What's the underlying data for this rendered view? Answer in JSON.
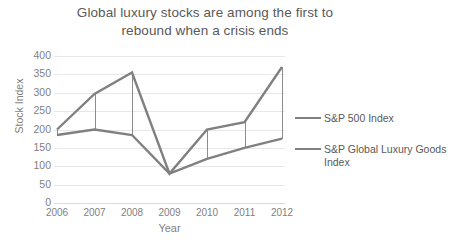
{
  "chart_data": {
    "type": "line",
    "title": "Global luxury stocks are among the first to rebound when a crisis ends",
    "title_line1": "Global luxury stocks are among the first to",
    "title_line2": "rebound when a crisis ends",
    "xlabel": "Year",
    "ylabel": "Stock Index",
    "categories": [
      "2006",
      "2007",
      "2008",
      "2009",
      "2010",
      "2011",
      "2012"
    ],
    "x": [
      2006,
      2007,
      2008,
      2009,
      2010,
      2011,
      2012
    ],
    "ylim": [
      0,
      400
    ],
    "ytick_labels": [
      "400",
      "350",
      "300",
      "250",
      "200",
      "150",
      "100",
      "50",
      "0"
    ],
    "ytick_values": [
      400,
      350,
      300,
      250,
      200,
      150,
      100,
      50,
      0
    ],
    "grid": true,
    "legend_position": "right",
    "series": [
      {
        "name": "S&P 500 Index",
        "color": "#808080",
        "values": [
          185,
          200,
          185,
          80,
          120,
          150,
          175
        ]
      },
      {
        "name": "S&P Global Luxury Goods Index",
        "name_line1": "S&P Global Luxury Goods",
        "name_line2": "Index",
        "color": "#808080",
        "values": [
          200,
          297,
          355,
          80,
          200,
          220,
          370
        ]
      }
    ]
  },
  "legend": {
    "entries": [
      {
        "label": "S&P 500 Index"
      },
      {
        "label_line1": "S&P Global Luxury Goods",
        "label_line2": "Index"
      }
    ]
  },
  "colors": {
    "series": "#808080",
    "grid": "#e8e8e8",
    "text": "#595959",
    "tick_text": "#7f7f7f",
    "background": "#ffffff"
  }
}
